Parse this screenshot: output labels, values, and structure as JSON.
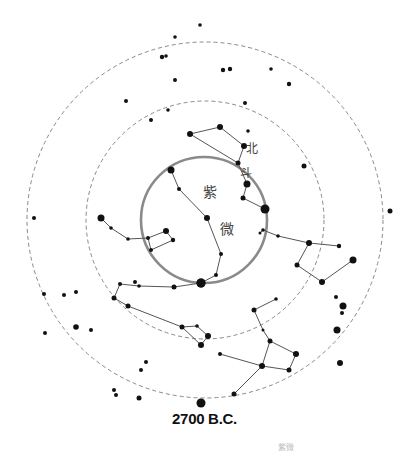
{
  "title": "2700 B.C.",
  "footer_faint": "紫微",
  "colors": {
    "star": "#111111",
    "line": "#555555",
    "dashed_circle": "#888888",
    "polar_circle": "#8a8a8a"
  },
  "labels": {
    "bei": "北",
    "dou": "斗",
    "zi": "紫",
    "wei": "微"
  },
  "circles": {
    "outer_dashed": {
      "cx": 205,
      "cy": 220,
      "r": 178
    },
    "inner_dashed": {
      "cx": 205,
      "cy": 220,
      "r": 119
    },
    "polar_solid": {
      "cx": 204,
      "cy": 220,
      "r": 63
    }
  },
  "stars": [
    [
      175,
      37,
      1.8
    ],
    [
      200,
      25,
      1.8
    ],
    [
      162,
      57,
      2.2
    ],
    [
      166,
      56,
      1.8
    ],
    [
      175,
      80,
      2
    ],
    [
      126,
      101,
      2
    ],
    [
      168,
      110,
      1.8
    ],
    [
      151,
      120,
      2
    ],
    [
      223,
      70,
      2.2
    ],
    [
      230,
      69,
      2.2
    ],
    [
      271,
      69,
      1.8
    ],
    [
      289,
      84,
      2.2
    ],
    [
      245,
      103,
      2
    ],
    [
      248,
      131,
      1.8
    ],
    [
      304,
      166,
      2.5
    ],
    [
      390,
      211,
      2.5
    ],
    [
      34,
      218,
      2
    ],
    [
      64,
      295,
      2
    ],
    [
      76,
      292,
      2
    ],
    [
      44,
      294,
      2
    ],
    [
      76,
      327,
      2.8
    ],
    [
      91,
      330,
      2
    ],
    [
      45,
      333,
      2
    ],
    [
      146,
      362,
      2
    ],
    [
      141,
      370,
      2
    ],
    [
      114,
      390,
      2
    ],
    [
      116,
      395,
      2
    ],
    [
      139,
      398,
      2.5
    ],
    [
      201,
      403,
      4.5
    ],
    [
      336,
      297,
      2
    ],
    [
      343,
      306,
      3.5
    ],
    [
      342,
      313,
      2
    ],
    [
      337,
      330,
      3.5
    ],
    [
      340,
      363,
      3
    ]
  ],
  "constellations": [
    {
      "name": "bei-dou",
      "points": [
        [
          190,
          134,
          3
        ],
        [
          220,
          127,
          3
        ],
        [
          244,
          146,
          3
        ],
        [
          238,
          163,
          2.5
        ],
        [
          247,
          184,
          3.5
        ],
        [
          243,
          198,
          2.5
        ],
        [
          265,
          209,
          4.5
        ]
      ],
      "edges": [
        [
          0,
          1
        ],
        [
          1,
          2
        ],
        [
          0,
          3
        ],
        [
          2,
          3
        ],
        [
          3,
          4
        ],
        [
          4,
          5
        ],
        [
          5,
          6
        ]
      ]
    },
    {
      "name": "zi-wei-left",
      "points": [
        [
          171,
          170,
          3.5
        ],
        [
          179,
          189,
          2
        ],
        [
          207,
          218,
          3
        ],
        [
          221,
          254,
          2
        ],
        [
          216,
          275,
          2
        ],
        [
          201,
          283,
          4.5
        ]
      ],
      "edges": [
        [
          0,
          1
        ],
        [
          1,
          2
        ],
        [
          2,
          3
        ],
        [
          3,
          4
        ],
        [
          4,
          5
        ]
      ]
    },
    {
      "name": "left-box",
      "points": [
        [
          101,
          218,
          3.5
        ],
        [
          111,
          228,
          1.8
        ],
        [
          128,
          239,
          1.8
        ],
        [
          148,
          238,
          2
        ],
        [
          166,
          231,
          3
        ],
        [
          173,
          240,
          2.2
        ],
        [
          151,
          250,
          2
        ]
      ],
      "edges": [
        [
          0,
          1
        ],
        [
          1,
          2
        ],
        [
          2,
          3
        ],
        [
          3,
          4
        ],
        [
          4,
          5
        ],
        [
          5,
          6
        ],
        [
          6,
          3
        ]
      ]
    },
    {
      "name": "lower-left",
      "points": [
        [
          201,
          283,
          4.5
        ],
        [
          174,
          287,
          2.5
        ],
        [
          139,
          286,
          1.8
        ],
        [
          120,
          284,
          2
        ],
        [
          114,
          298,
          2.5
        ],
        [
          128,
          306,
          2.5
        ],
        [
          182,
          327,
          2.5
        ],
        [
          197,
          326,
          1.8
        ],
        [
          208,
          336,
          3
        ],
        [
          201,
          345,
          3
        ],
        [
          135,
          282,
          2
        ]
      ],
      "edges": [
        [
          0,
          1
        ],
        [
          1,
          2
        ],
        [
          2,
          3
        ],
        [
          3,
          4
        ],
        [
          4,
          5
        ],
        [
          5,
          6
        ],
        [
          6,
          7
        ],
        [
          7,
          8
        ],
        [
          8,
          9
        ],
        [
          9,
          6
        ]
      ]
    },
    {
      "name": "right",
      "points": [
        [
          263,
          230,
          1.8
        ],
        [
          260,
          233,
          1.5
        ],
        [
          278,
          236,
          1.8
        ],
        [
          309,
          243,
          3
        ],
        [
          339,
          246,
          2.2
        ],
        [
          297,
          265,
          2.5
        ],
        [
          322,
          282,
          3
        ],
        [
          353,
          260,
          3.5
        ]
      ],
      "edges": [
        [
          0,
          2
        ],
        [
          0,
          1
        ],
        [
          2,
          3
        ],
        [
          3,
          4
        ],
        [
          3,
          5
        ],
        [
          5,
          6
        ],
        [
          6,
          7
        ]
      ]
    },
    {
      "name": "lower-right",
      "points": [
        [
          276,
          299,
          1.8
        ],
        [
          254,
          310,
          2.5
        ],
        [
          263,
          330,
          1.5
        ],
        [
          270,
          341,
          2.5
        ],
        [
          296,
          354,
          3
        ],
        [
          289,
          370,
          2.5
        ],
        [
          262,
          366,
          3
        ],
        [
          220,
          354,
          2
        ],
        [
          234,
          394,
          2.5
        ]
      ],
      "edges": [
        [
          0,
          1
        ],
        [
          1,
          2
        ],
        [
          2,
          3
        ],
        [
          3,
          4
        ],
        [
          4,
          5
        ],
        [
          5,
          6
        ],
        [
          6,
          3
        ],
        [
          6,
          7
        ],
        [
          6,
          8
        ]
      ]
    }
  ],
  "label_positions": {
    "bei": [
      246,
      153
    ],
    "dou": [
      240,
      177
    ],
    "zi": [
      203,
      197
    ],
    "wei": [
      220,
      234
    ]
  }
}
